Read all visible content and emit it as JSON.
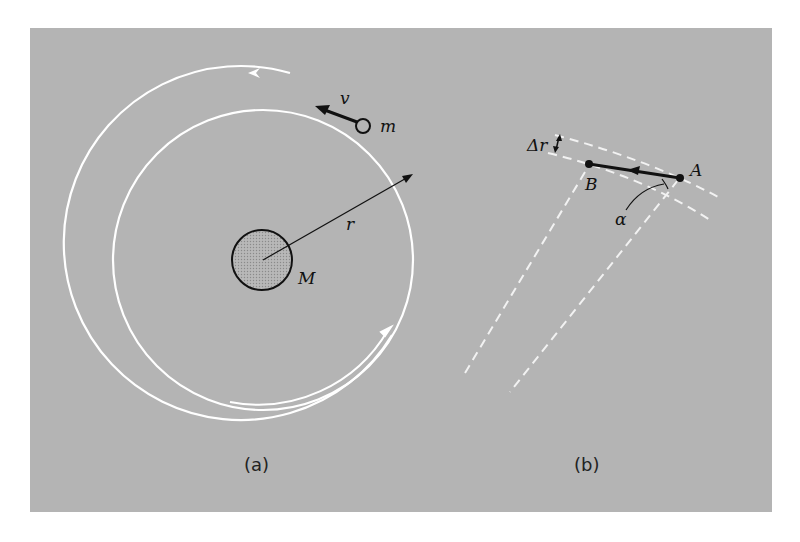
{
  "figure": {
    "background_color": "#b4b4b4",
    "orbit_color": "#ffffff",
    "ink_color": "#111111",
    "panel_a": {
      "caption": "(a)",
      "labels": {
        "velocity": "v",
        "small_mass": "m",
        "radius": "r",
        "central_mass": "M"
      }
    },
    "panel_b": {
      "caption": "(b)",
      "labels": {
        "delta_r": "Δr",
        "point_a": "A",
        "point_b": "B",
        "angle": "α"
      }
    }
  }
}
